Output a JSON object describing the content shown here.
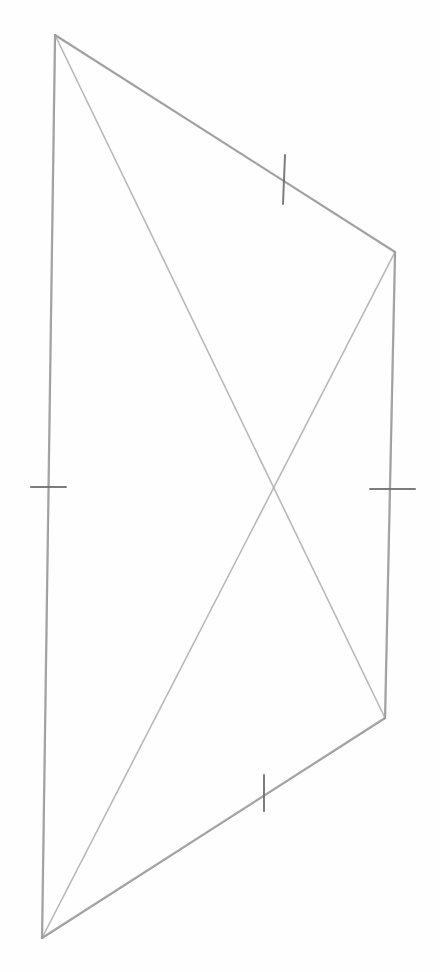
{
  "figure": {
    "type": "geometry-sketch",
    "width": 440,
    "height": 972,
    "background": "#fefefe",
    "stroke_color": "#8a8a8a",
    "diagonal_color": "#a6a6a6",
    "tick_color": "#6e6e6e"
  },
  "vertices": [
    {
      "id": "A",
      "x": 55,
      "y": 35
    },
    {
      "id": "B",
      "x": 395,
      "y": 252
    },
    {
      "id": "C",
      "x": 385,
      "y": 718
    },
    {
      "id": "D",
      "x": 42,
      "y": 938
    }
  ],
  "sides": [
    {
      "id": "AB",
      "from": "A",
      "to": "B",
      "ticks": 1
    },
    {
      "id": "BC",
      "from": "B",
      "to": "C",
      "ticks": 1
    },
    {
      "id": "CD",
      "from": "C",
      "to": "D",
      "ticks": 1
    },
    {
      "id": "DA",
      "from": "D",
      "to": "A",
      "ticks": 1
    }
  ],
  "diagonals": [
    {
      "id": "AC",
      "from": "A",
      "to": "C"
    },
    {
      "id": "BD",
      "from": "B",
      "to": "D"
    }
  ],
  "tick_marks": [
    {
      "side": "AB",
      "x1": 285,
      "y1": 155,
      "x2": 283,
      "y2": 204
    },
    {
      "side": "BC",
      "x1": 370,
      "y1": 489,
      "x2": 415,
      "y2": 489
    },
    {
      "side": "CD",
      "x1": 264,
      "y1": 775,
      "x2": 264,
      "y2": 811
    },
    {
      "side": "DA",
      "x1": 31,
      "y1": 487,
      "x2": 66,
      "y2": 487
    }
  ],
  "diagonal_intersection": {
    "x": 273,
    "y": 484
  }
}
